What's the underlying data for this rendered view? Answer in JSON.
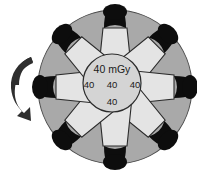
{
  "figure": {
    "name": "rotating-dose-phantom-diagram",
    "background_color": "#ffffff",
    "outer_disc_color": "#a9a9a9",
    "outer_disc_stroke": "#4a4a4a",
    "wedge_fill_color": "#e4e4e4",
    "wedge_stroke": "#2b2b2b",
    "detector_color": "#0d0d0d",
    "center_circle_fill": "#d0d0d0",
    "center_circle_stroke": "#2b2b2b",
    "arrow_color": "#2e2e2e"
  },
  "center": {
    "dose_label": "40 mGy",
    "left_value": "40",
    "middle_value": "40",
    "right_value": "40",
    "bottom_value": "40"
  },
  "rotation": {
    "arrow_name": "counterclockwise-rotation-arrow",
    "direction": "counterclockwise"
  },
  "elements": {
    "wedge_count": 8,
    "detector_count": 8
  }
}
